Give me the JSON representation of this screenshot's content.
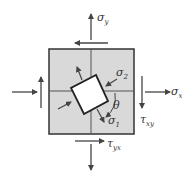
{
  "diagram": {
    "type": "plane stress element with principal stress orientation",
    "colors": {
      "element_fill": "#d9d9d9",
      "outline": "#333333",
      "arrow": "#444444",
      "inner_fill": "#ffffff"
    },
    "labels": {
      "sigma_y": {
        "symbol": "σ",
        "sub": "y"
      },
      "sigma_x": {
        "symbol": "σ",
        "sub": "x"
      },
      "sigma_1": {
        "symbol": "σ",
        "sub": "1"
      },
      "sigma_2": {
        "symbol": "σ",
        "sub": "2"
      },
      "tau_xy": {
        "symbol": "τ",
        "sub": "xy"
      },
      "tau_yx": {
        "symbol": "τ",
        "sub": "yx"
      },
      "theta": "θ"
    }
  }
}
